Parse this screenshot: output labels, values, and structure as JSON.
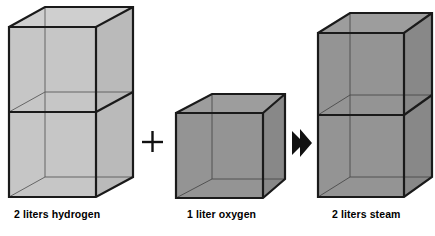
{
  "figure": {
    "kind": "chemical-volume-diagram",
    "background_color": "#ffffff",
    "equation_text": "2 liters hydrogen + 1 liter oxygen → 2 liters steam"
  },
  "operators": {
    "plus": {
      "glyph": "+",
      "name": "plus-sign",
      "x": 152,
      "y": 142
    },
    "arrow": {
      "glyph": "➤",
      "name": "right-arrow",
      "x": 300,
      "y": 143
    }
  },
  "boxes": [
    {
      "id": "hydrogen",
      "label": "2 liters hydrogen",
      "volume_liters": 2,
      "units_tall": 2,
      "fill_color": "#c6c6c6",
      "top_face_color": "#cfcfcf",
      "side_face_color": "#bdbdbd",
      "edge_color": "#1a1a1a",
      "hidden_edge_color": "#5a5a5a"
    },
    {
      "id": "oxygen",
      "label": "1 liter oxygen",
      "volume_liters": 1,
      "units_tall": 1,
      "fill_color": "#949494",
      "top_face_color": "#9d9d9d",
      "side_face_color": "#8b8b8b",
      "edge_color": "#1a1a1a",
      "hidden_edge_color": "#4a4a4a"
    },
    {
      "id": "steam",
      "label": "2 liters steam",
      "volume_liters": 2,
      "units_tall": 2,
      "fill_color": "#949494",
      "top_face_color": "#9d9d9d",
      "side_face_color": "#8b8b8b",
      "edge_color": "#1a1a1a",
      "hidden_edge_color": "#4a4a4a"
    }
  ],
  "captions": {
    "hydrogen": "2 liters hydrogen",
    "oxygen": "1 liter oxygen",
    "steam": "2 liters steam"
  }
}
